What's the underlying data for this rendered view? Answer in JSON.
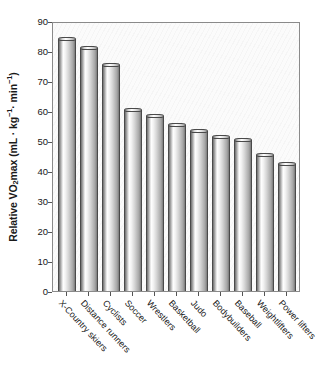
{
  "chart_data": {
    "type": "bar",
    "title": "",
    "subtitle": "",
    "xlabel": "",
    "ylabel": "Relative VO2 max (mL · kg⁻¹ · min⁻¹)",
    "ylabel_parts": {
      "prefix": "Relative VO",
      "sub": "2",
      "mid": " max (mL · kg",
      "sup1": "−1",
      "mid2": " · min",
      "sup2": "−1",
      "suffix": ")"
    },
    "categories": [
      "X-Country skiers",
      "Distance runners",
      "Cyclists",
      "Soccer",
      "Wrestlers",
      "Basketball",
      "Judo",
      "Bodybuilders",
      "Baseball",
      "Weightlifters",
      "Power lifters"
    ],
    "values": [
      84.0,
      81.0,
      75.5,
      60.5,
      58.3,
      55.5,
      53.5,
      51.2,
      50.3,
      45.3,
      42.3
    ],
    "ylim": [
      0,
      90
    ],
    "ytick_values": [
      0,
      10,
      20,
      30,
      40,
      50,
      60,
      70,
      80,
      90
    ],
    "ytick_labels": [
      "0",
      "10",
      "20",
      "30",
      "40",
      "50",
      "60",
      "70",
      "80",
      "90"
    ],
    "grid": false,
    "legend": null,
    "legend_position": "none",
    "annotations": [],
    "colors": {
      "bar_edge": "#4a4a4a",
      "bar_light": "#ffffff",
      "bar_dark": "#6f6f6f",
      "axis": "#8a8a8a",
      "plot_background": "#fbfbfb",
      "text": "#171717"
    }
  }
}
